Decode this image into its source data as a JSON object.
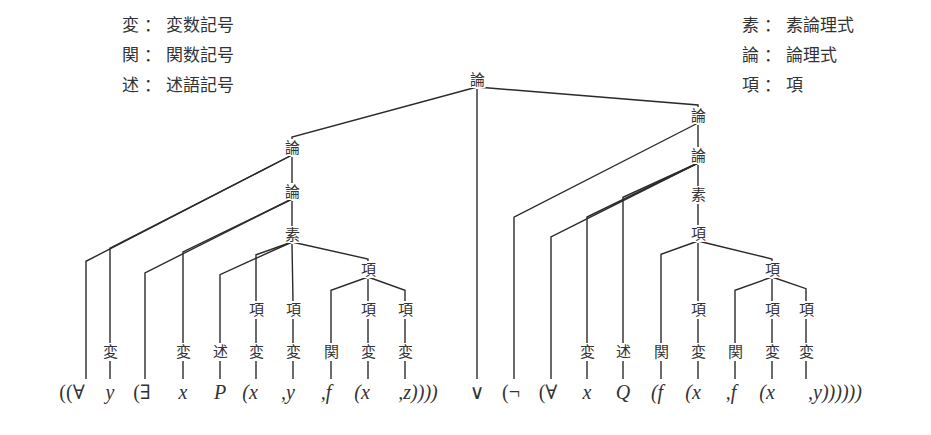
{
  "legend_left": [
    {
      "key": "変",
      "sep": "：",
      "meaning": "変数記号"
    },
    {
      "key": "関",
      "sep": "：",
      "meaning": "関数記号"
    },
    {
      "key": "述",
      "sep": "：",
      "meaning": "述語記号"
    }
  ],
  "legend_right": [
    {
      "key": "素",
      "sep": "：",
      "meaning": "素論理式"
    },
    {
      "key": "論",
      "sep": "：",
      "meaning": "論理式"
    },
    {
      "key": "項",
      "sep": "：",
      "meaning": "項"
    }
  ],
  "formula": {
    "tokens": [
      {
        "id": "t0",
        "text": "((∀",
        "x": 72,
        "italic": false,
        "anchor": 86
      },
      {
        "id": "t1",
        "text": "y",
        "x": 110,
        "italic": true
      },
      {
        "id": "t2",
        "text": "(∃",
        "x": 142,
        "italic": false,
        "anchor": 145
      },
      {
        "id": "t3",
        "text": "x",
        "x": 183,
        "italic": true
      },
      {
        "id": "t4",
        "text": "P",
        "x": 220,
        "italic": true
      },
      {
        "id": "t5",
        "text": "(x",
        "x": 250,
        "italic": true,
        "anchor": 256
      },
      {
        "id": "t6",
        "text": ",y",
        "x": 288,
        "italic": true,
        "anchor": 293
      },
      {
        "id": "t7",
        "text": ",f",
        "x": 326,
        "italic": true,
        "anchor": 331
      },
      {
        "id": "t8",
        "text": "(x",
        "x": 362,
        "italic": true,
        "anchor": 368
      },
      {
        "id": "t9",
        "text": ",z))))",
        "x": 418,
        "italic": true,
        "anchor": 405
      },
      {
        "id": "t10",
        "text": "∨",
        "x": 477,
        "italic": false
      },
      {
        "id": "t11",
        "text": "(¬",
        "x": 511,
        "italic": false,
        "anchor": 514
      },
      {
        "id": "t12",
        "text": "(∀",
        "x": 548,
        "italic": false,
        "anchor": 551
      },
      {
        "id": "t13",
        "text": "x",
        "x": 587,
        "italic": true
      },
      {
        "id": "t14",
        "text": "Q",
        "x": 623,
        "italic": true
      },
      {
        "id": "t15",
        "text": "(f",
        "x": 657,
        "italic": true,
        "anchor": 661
      },
      {
        "id": "t16",
        "text": "(x",
        "x": 693,
        "italic": true,
        "anchor": 698
      },
      {
        "id": "t17",
        "text": ",f",
        "x": 731,
        "italic": true,
        "anchor": 735
      },
      {
        "id": "t18",
        "text": "(x",
        "x": 767,
        "italic": true,
        "anchor": 772
      },
      {
        "id": "t19",
        "text": ",y))))))",
        "x": 835,
        "italic": true,
        "anchor": 806
      }
    ],
    "baseline_y": 392
  },
  "tree": {
    "nodes": [
      {
        "id": "n_root",
        "label": "論",
        "x": 477,
        "y": 80,
        "meaning": "論理式"
      },
      {
        "id": "n_L1",
        "label": "論",
        "x": 292,
        "y": 148
      },
      {
        "id": "n_L2",
        "label": "論",
        "x": 292,
        "y": 192
      },
      {
        "id": "n_L3",
        "label": "素",
        "x": 292,
        "y": 235
      },
      {
        "id": "n_Ly",
        "label": "変",
        "x": 110,
        "y": 352
      },
      {
        "id": "n_Lx",
        "label": "変",
        "x": 183,
        "y": 352
      },
      {
        "id": "n_LP",
        "label": "述",
        "x": 220,
        "y": 352
      },
      {
        "id": "n_Lt1",
        "label": "項",
        "x": 256,
        "y": 310
      },
      {
        "id": "n_Lv1",
        "label": "変",
        "x": 256,
        "y": 352
      },
      {
        "id": "n_Lt2",
        "label": "項",
        "x": 293,
        "y": 310
      },
      {
        "id": "n_Lv2",
        "label": "変",
        "x": 293,
        "y": 352
      },
      {
        "id": "n_Lt3",
        "label": "項",
        "x": 368,
        "y": 270
      },
      {
        "id": "n_Lf",
        "label": "関",
        "x": 331,
        "y": 352
      },
      {
        "id": "n_Lt4",
        "label": "項",
        "x": 368,
        "y": 310
      },
      {
        "id": "n_Lv4",
        "label": "変",
        "x": 368,
        "y": 352
      },
      {
        "id": "n_Lt5",
        "label": "項",
        "x": 405,
        "y": 310
      },
      {
        "id": "n_Lv5",
        "label": "変",
        "x": 405,
        "y": 352
      },
      {
        "id": "n_R1",
        "label": "論",
        "x": 698,
        "y": 116
      },
      {
        "id": "n_R2",
        "label": "論",
        "x": 698,
        "y": 156
      },
      {
        "id": "n_R3",
        "label": "素",
        "x": 698,
        "y": 195
      },
      {
        "id": "n_R4",
        "label": "項",
        "x": 698,
        "y": 234
      },
      {
        "id": "n_Rx",
        "label": "変",
        "x": 587,
        "y": 352
      },
      {
        "id": "n_RQ",
        "label": "述",
        "x": 623,
        "y": 352
      },
      {
        "id": "n_Rf1",
        "label": "関",
        "x": 661,
        "y": 352
      },
      {
        "id": "n_Rt1",
        "label": "項",
        "x": 698,
        "y": 310
      },
      {
        "id": "n_Rv1",
        "label": "変",
        "x": 698,
        "y": 352
      },
      {
        "id": "n_Rt2",
        "label": "項",
        "x": 772,
        "y": 270
      },
      {
        "id": "n_Rf2",
        "label": "関",
        "x": 735,
        "y": 352
      },
      {
        "id": "n_Rt3",
        "label": "項",
        "x": 772,
        "y": 310
      },
      {
        "id": "n_Rv3",
        "label": "変",
        "x": 772,
        "y": 352
      },
      {
        "id": "n_Rt4",
        "label": "項",
        "x": 806,
        "y": 310
      },
      {
        "id": "n_Rv4",
        "label": "変",
        "x": 806,
        "y": 352
      }
    ],
    "edges": [
      [
        "n_root",
        "n_L1"
      ],
      [
        "n_root",
        "t10"
      ],
      [
        "n_root",
        "n_R1"
      ],
      [
        "n_L1",
        "t0"
      ],
      [
        "n_L1",
        "n_Ly"
      ],
      [
        "n_L1",
        "n_L2"
      ],
      [
        "n_Ly",
        "t1"
      ],
      [
        "n_L2",
        "t2"
      ],
      [
        "n_L2",
        "n_Lx"
      ],
      [
        "n_L2",
        "n_L3"
      ],
      [
        "n_Lx",
        "t3"
      ],
      [
        "n_L3",
        "n_LP"
      ],
      [
        "n_L3",
        "n_Lt1"
      ],
      [
        "n_L3",
        "n_Lt2"
      ],
      [
        "n_L3",
        "n_Lt3"
      ],
      [
        "n_LP",
        "t4"
      ],
      [
        "n_Lt1",
        "n_Lv1"
      ],
      [
        "n_Lv1",
        "t5"
      ],
      [
        "n_Lt2",
        "n_Lv2"
      ],
      [
        "n_Lv2",
        "t6"
      ],
      [
        "n_Lt3",
        "n_Lf"
      ],
      [
        "n_Lt3",
        "n_Lt4"
      ],
      [
        "n_Lt3",
        "n_Lt5"
      ],
      [
        "n_Lf",
        "t7"
      ],
      [
        "n_Lt4",
        "n_Lv4"
      ],
      [
        "n_Lv4",
        "t8"
      ],
      [
        "n_Lt5",
        "n_Lv5"
      ],
      [
        "n_Lv5",
        "t9"
      ],
      [
        "n_R1",
        "t11"
      ],
      [
        "n_R1",
        "n_R2"
      ],
      [
        "n_R2",
        "t12"
      ],
      [
        "n_R2",
        "n_Rx"
      ],
      [
        "n_R2",
        "n_RQ"
      ],
      [
        "n_R2",
        "n_R3"
      ],
      [
        "n_Rx",
        "t13"
      ],
      [
        "n_RQ",
        "t14"
      ],
      [
        "n_R3",
        "n_R4"
      ],
      [
        "n_R4",
        "n_Rf1"
      ],
      [
        "n_R4",
        "n_Rt1"
      ],
      [
        "n_R4",
        "n_Rt2"
      ],
      [
        "n_Rf1",
        "t15"
      ],
      [
        "n_Rt1",
        "n_Rv1"
      ],
      [
        "n_Rv1",
        "t16"
      ],
      [
        "n_Rt2",
        "n_Rf2"
      ],
      [
        "n_Rt2",
        "n_Rt3"
      ],
      [
        "n_Rt2",
        "n_Rt4"
      ],
      [
        "n_Rf2",
        "t17"
      ],
      [
        "n_Rt3",
        "n_Rv3"
      ],
      [
        "n_Rv3",
        "t18"
      ],
      [
        "n_Rt4",
        "n_Rv4"
      ],
      [
        "n_Rv4",
        "t19"
      ]
    ]
  },
  "style": {
    "line_color": "#2b2b2b",
    "text_color": "#333333",
    "background": "#ffffff"
  }
}
